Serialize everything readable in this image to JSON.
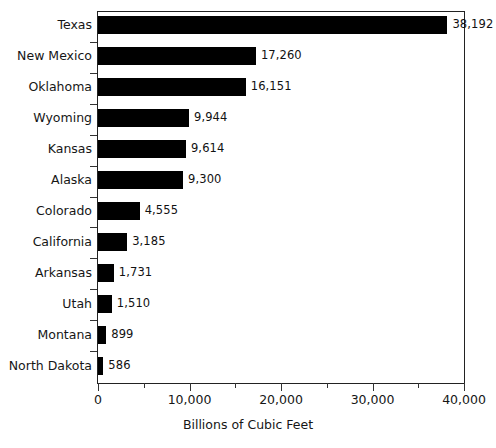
{
  "chart_data": {
    "type": "bar",
    "orientation": "horizontal",
    "title": "",
    "subtitle": "",
    "xlabel": "Billions of Cubic Feet",
    "ylabel": "",
    "xlim": [
      0,
      40000
    ],
    "grid": false,
    "legend": null,
    "categories": [
      "Texas",
      "New Mexico",
      "Oklahoma",
      "Wyoming",
      "Kansas",
      "Alaska",
      "Colorado",
      "California",
      "Arkansas",
      "Utah",
      "Montana",
      "North Dakota"
    ],
    "values": [
      38192,
      17260,
      16151,
      9944,
      9614,
      9300,
      4555,
      3185,
      1731,
      1510,
      899,
      586
    ],
    "data_labels": [
      "38,192",
      "17,260",
      "16,151",
      "9,944",
      "9,614",
      "9,300",
      "4,555",
      "3,185",
      "1,731",
      "1,510",
      "899",
      "586"
    ],
    "x_ticks": [
      0,
      10000,
      20000,
      30000,
      40000
    ],
    "x_tick_labels": [
      "0",
      "10,000",
      "20,000",
      "30,000",
      "40,000"
    ],
    "x_minor_ticks": [
      5000,
      15000,
      25000,
      35000
    ],
    "bar_color": "#000000",
    "frame_color": "#222222",
    "background_color": "#ffffff"
  }
}
